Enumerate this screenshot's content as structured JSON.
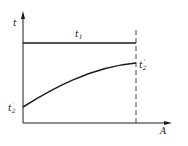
{
  "diagram": {
    "y_axis_label": "t",
    "x_axis_label": "A",
    "top_line_label": "t",
    "top_line_sub": "1",
    "curve_end_label": "t",
    "curve_end_sub": "2",
    "curve_end_sup": "″",
    "curve_start_label": "t",
    "curve_start_sub": "2",
    "curve_start_sup": "′",
    "colors": {
      "line": "#1a1a1a",
      "background": "#ffffff"
    }
  }
}
